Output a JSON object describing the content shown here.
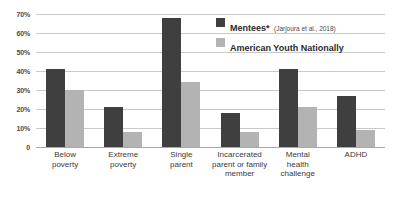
{
  "chart_data": {
    "type": "bar",
    "title": "",
    "xlabel": "",
    "ylabel": "",
    "ylim": [
      0,
      70
    ],
    "grid": true,
    "legend_position": "top-right",
    "categories": [
      "Below poverty",
      "Extreme poverty",
      "Single parent",
      "Incarcerated parent or family member",
      "Mental health challenge",
      "ADHD"
    ],
    "category_lines": [
      [
        "Below",
        "poverty"
      ],
      [
        "Extreme",
        "poverty"
      ],
      [
        "Single",
        "parent"
      ],
      [
        "Incarcerated",
        "parent or family",
        "member"
      ],
      [
        "Mental",
        "health",
        "challenge"
      ],
      [
        "ADHD"
      ]
    ],
    "series": [
      {
        "name": "Mentees*",
        "subtitle": "(Jarjoura et al., 2018)",
        "color": "#3f3f3f",
        "values": [
          41,
          21,
          68,
          18,
          41,
          27
        ]
      },
      {
        "name": "American Youth Nationally",
        "subtitle": "",
        "color": "#b3b3b3",
        "values": [
          30,
          8,
          34,
          8,
          21,
          9
        ]
      }
    ],
    "yticks": [
      {
        "value": 70,
        "label": "70%"
      },
      {
        "value": 60,
        "label": "60%"
      },
      {
        "value": 50,
        "label": "50%"
      },
      {
        "value": 40,
        "label": "40%"
      },
      {
        "value": 30,
        "label": "30%"
      },
      {
        "value": 20,
        "label": "20%"
      },
      {
        "value": 10,
        "label": "10%"
      },
      {
        "value": 0,
        "label": "0"
      }
    ]
  }
}
